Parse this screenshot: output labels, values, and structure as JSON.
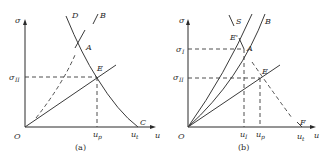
{
  "panels": [
    {
      "id": "a",
      "caption": "(a)",
      "axes": {
        "y": "σ",
        "x": "u",
        "origin": "O"
      },
      "y_ticks": [
        "σ_II"
      ],
      "x_ticks": [
        "u_p",
        "u_t"
      ],
      "curve_labels": {
        "D": "D",
        "B": "B",
        "A": "A",
        "E": "E",
        "C": "C"
      }
    },
    {
      "id": "b",
      "caption": "(b)",
      "axes": {
        "y": "σ",
        "x": "u",
        "origin": "O"
      },
      "y_ticks": [
        "σ_I",
        "σ_II"
      ],
      "x_ticks": [
        "u_I",
        "u_p",
        "u_t"
      ],
      "curve_labels": {
        "S": "S",
        "B": "B",
        "E1": "E'",
        "A": "A",
        "E": "E",
        "F": "F"
      }
    }
  ],
  "text": {
    "a_sigma": "σ",
    "a_u": "u",
    "a_O": "O",
    "a_sigII": "σ",
    "a_sigII_sub": "II",
    "a_up": "u",
    "a_up_sub": "p",
    "a_ut": "u",
    "a_ut_sub": "t",
    "a_D": "D",
    "a_B": "B",
    "a_A": "A",
    "a_E": "E",
    "a_C": "C",
    "a_cap": "(a)",
    "b_sigma": "σ",
    "b_u": "u",
    "b_O": "O",
    "b_sigI": "σ",
    "b_sigI_sub": "I",
    "b_sigII": "σ",
    "b_sigII_sub": "II",
    "b_uI": "u",
    "b_uI_sub": "I",
    "b_up": "u",
    "b_up_sub": "p",
    "b_ut": "u",
    "b_ut_sub": "t",
    "b_S": "S",
    "b_B": "B",
    "b_E1": "E'",
    "b_A": "A",
    "b_E": "E",
    "b_F": "F",
    "b_cap": "(b)"
  }
}
